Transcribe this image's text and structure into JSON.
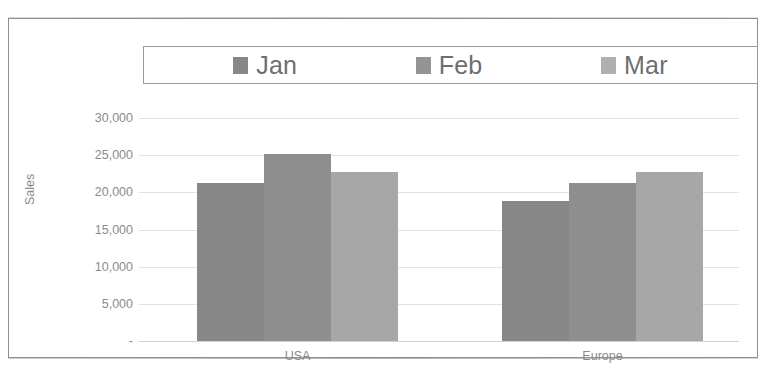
{
  "chart_data": {
    "type": "bar",
    "title": "",
    "subtitle": "",
    "xlabel": "",
    "ylabel": "Sales",
    "categories": [
      "USA",
      "Europe"
    ],
    "series": [
      {
        "name": "Jan",
        "values": [
          21300,
          18800
        ],
        "color": "#878787"
      },
      {
        "name": "Feb",
        "values": [
          25100,
          21200
        ],
        "color": "#8e8e8e"
      },
      {
        "name": "Mar",
        "values": [
          22700,
          22800
        ],
        "color": "#a7a7a7"
      }
    ],
    "ylim": [
      0,
      30000
    ],
    "yticks": [
      0,
      5000,
      10000,
      15000,
      20000,
      25000,
      30000
    ],
    "ytick_labels": [
      "-",
      "5,000",
      "10,000",
      "15,000",
      "20,000",
      "25,000",
      "30,000"
    ],
    "grid": true,
    "legend_position": "top",
    "bar_gap_within_group": 0
  },
  "legend": {
    "entries": [
      {
        "label": "Jan",
        "swatch_color": "#878787"
      },
      {
        "label": "Feb",
        "swatch_color": "#949494"
      },
      {
        "label": "Mar",
        "swatch_color": "#b0b0b0"
      }
    ]
  },
  "axis": {
    "y_title": "Sales",
    "y_ticks": [
      "30,000",
      "25,000",
      "20,000",
      "15,000",
      "10,000",
      "5,000",
      "-"
    ],
    "x_ticks": [
      "USA",
      "Europe"
    ]
  },
  "colors": {
    "frame": "#8f8f8f",
    "gridline": "#e3e3e3",
    "text": "#8b8b8b",
    "legend_text": "#6e6e6e",
    "background": "#ffffff"
  }
}
